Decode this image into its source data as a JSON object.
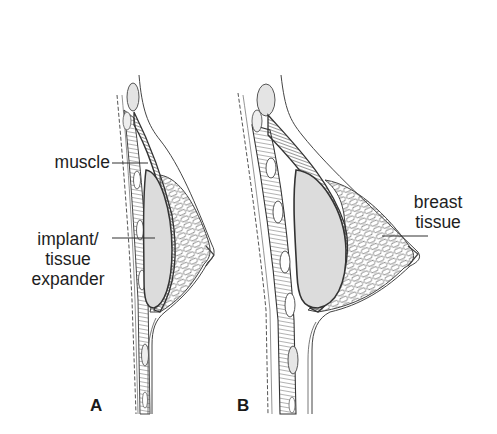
{
  "figure": {
    "panels": [
      {
        "id": "A",
        "letter": "A",
        "labels": {
          "muscle": "muscle",
          "implant_line1": "implant/",
          "implant_line2": "tissue",
          "implant_line3": "expander"
        }
      },
      {
        "id": "B",
        "letter": "B",
        "labels": {
          "breast_tissue_line1": "breast",
          "breast_tissue_line2": "tissue"
        }
      }
    ],
    "colors": {
      "implant_fill": "#dcdcdc",
      "line": "#3a3a3a",
      "muscle_dark": "#4a4a4a",
      "background": "#ffffff"
    }
  }
}
